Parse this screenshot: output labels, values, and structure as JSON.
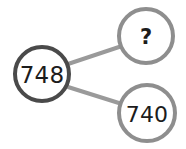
{
  "diagram": {
    "type": "number-bond",
    "background_color": "#ffffff",
    "connector_color": "#9a9a9a",
    "connector_width": 4,
    "whole_node": {
      "label": "748",
      "stroke_color": "#4a4a4a",
      "fill_color": "#ffffff",
      "stroke_width": 4,
      "cx": 42,
      "cy": 74,
      "r": 27
    },
    "part_nodes": [
      {
        "label": "?",
        "name": "unknown",
        "stroke_color": "#8e8e8e",
        "fill_color": "#ffffff",
        "stroke_width": 4,
        "cx": 146,
        "cy": 36,
        "r": 27
      },
      {
        "label": "740",
        "name": "known",
        "stroke_color": "#8e8e8e",
        "fill_color": "#ffffff",
        "stroke_width": 4,
        "cx": 147,
        "cy": 113,
        "r": 28
      }
    ],
    "connectors": [
      {
        "name": "whole-to-unknown",
        "x1": 68,
        "y1": 64,
        "x2": 122,
        "y2": 46
      },
      {
        "name": "whole-to-known",
        "x1": 68,
        "y1": 87,
        "x2": 122,
        "y2": 104
      }
    ]
  }
}
